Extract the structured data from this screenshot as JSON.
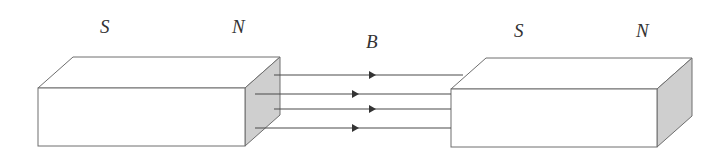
{
  "diagram": {
    "magnets": [
      {
        "id": "left-magnet",
        "labels": {
          "south": "S",
          "north": "N"
        },
        "front": {
          "x1": 38,
          "y1": 88,
          "x2": 245,
          "y2": 146
        },
        "depth": {
          "dx": 35,
          "dy": -31
        },
        "shaded_face": "right",
        "label_positions": {
          "south": [
            100,
            33
          ],
          "north": [
            238,
            33
          ]
        }
      },
      {
        "id": "right-magnet",
        "labels": {
          "south": "S",
          "north": "N"
        },
        "front": {
          "x1": 451,
          "y1": 89,
          "x2": 657,
          "y2": 147
        },
        "depth": {
          "dx": 35,
          "dy": -31
        },
        "shaded_face": "right",
        "label_positions": {
          "south": [
            520,
            37
          ],
          "north": [
            643,
            37
          ]
        }
      }
    ],
    "field": {
      "label": "B",
      "label_position": [
        372,
        48
      ],
      "direction": "left-to-right",
      "lines": [
        {
          "y": 75,
          "x_start": 274,
          "x_end": 463,
          "arrow_x": 372
        },
        {
          "y": 94,
          "x_start": 255,
          "x_end": 451,
          "arrow_x": 355
        },
        {
          "y": 109,
          "x_start": 274,
          "x_end": 451,
          "arrow_x": 372
        },
        {
          "y": 128,
          "x_start": 255,
          "x_end": 451,
          "arrow_x": 355
        }
      ]
    },
    "colors": {
      "outline": "#6e6e6e",
      "shaded_face": "#cfcfcf",
      "field_line": "#4a4a4a",
      "text": "#333333"
    }
  }
}
